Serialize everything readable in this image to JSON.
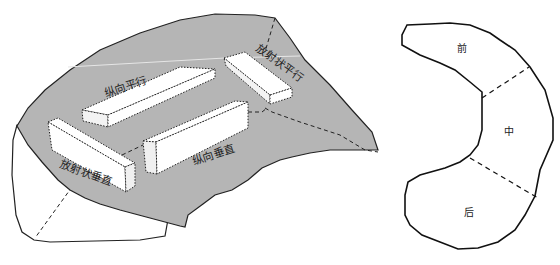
{
  "left_diagram": {
    "name": "wall-orientation-diagram",
    "fill_color": "#b5b5b5",
    "labels": {
      "longitudinal_parallel": "纵向平行",
      "radial_parallel": "放射状平行",
      "longitudinal_vertical": "纵向垂直",
      "radial_vertical": "放射状垂直"
    }
  },
  "right_diagram": {
    "name": "kidney-section-diagram",
    "labels": {
      "front": "前",
      "middle": "中",
      "back": "后"
    }
  }
}
